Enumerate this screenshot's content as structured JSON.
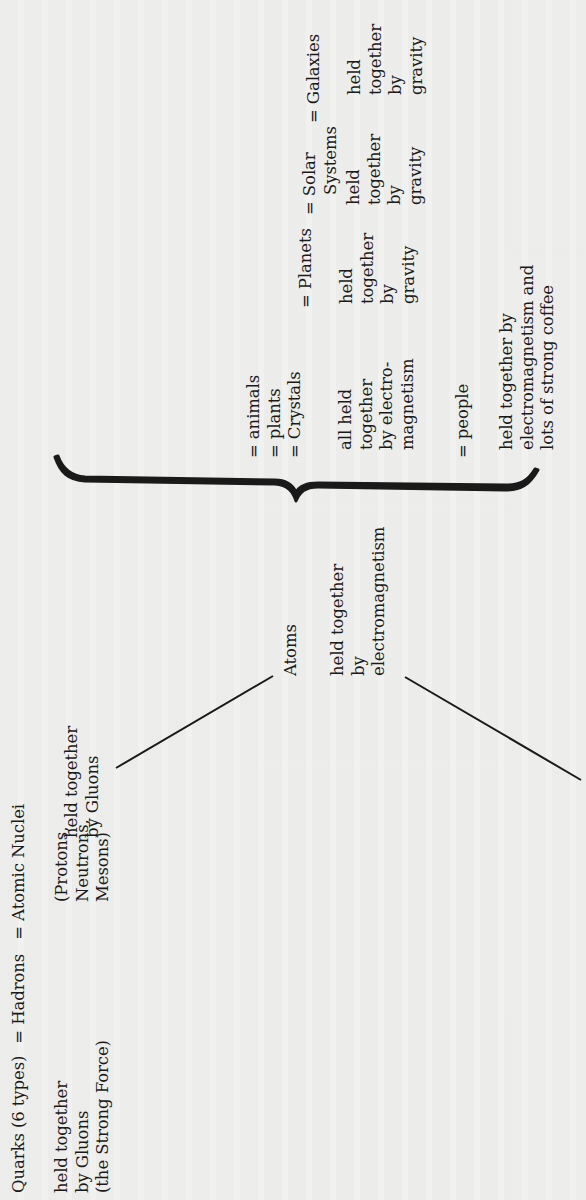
{
  "diagram": {
    "orientation": "rotated 90deg counter-clockwise",
    "chain": {
      "quarks": "Quarks (6 types)",
      "hadrons": "= Hadrons",
      "atomic_nuclei": "= Atomic Nuclei",
      "atoms": "Atoms"
    },
    "quarks_note": [
      "held together",
      "by Gluons",
      "(the Strong Force)"
    ],
    "hadrons_note": [
      "(Protons,",
      "Neutrons,",
      "Mesons)"
    ],
    "nuclei_note": [
      "held together",
      "by Gluons"
    ],
    "atoms_note": [
      "held together",
      "by",
      "electromagnetism"
    ],
    "brace_upper_group": {
      "items": [
        "= animals",
        "= plants",
        "= Crystals"
      ],
      "note": [
        "all held",
        "together",
        "by electro-",
        "magnetism"
      ]
    },
    "brace_lower_group": {
      "item": "= people",
      "note": [
        "held together by",
        "electromagnetism and",
        "lots of strong coffee"
      ]
    },
    "planets": {
      "label": "= Planets",
      "note": [
        "held",
        "together",
        "by",
        "gravity"
      ]
    },
    "solar_systems": {
      "label": [
        "= Solar",
        "Systems"
      ],
      "note": [
        "held",
        "together",
        "by",
        "gravity"
      ]
    },
    "galaxies": {
      "label": "= Galaxies",
      "note": [
        "held",
        "together",
        "by",
        "gravity"
      ]
    },
    "colors": {
      "ink": "#1a1a1a",
      "paper": "#f1f1ef"
    }
  }
}
